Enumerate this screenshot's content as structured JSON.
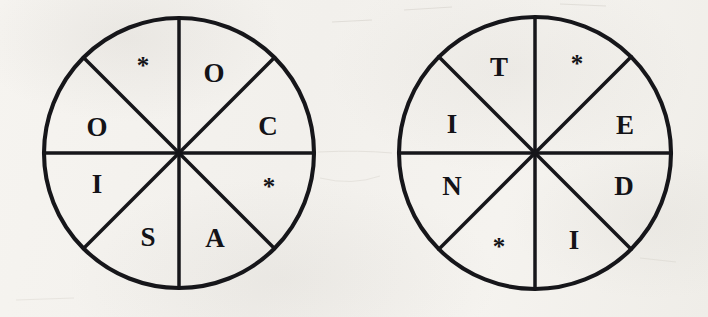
{
  "page": {
    "background_color": "#f4f2ee",
    "ink_color": "#16161a",
    "width": 708,
    "height": 317
  },
  "wheels": [
    {
      "id": "wheel-left",
      "name": "left-word-wheel",
      "center_x": 179,
      "center_y": 153,
      "radius": 135,
      "sector_count": 8,
      "sectors": [
        {
          "position": "top-right",
          "angle_deg": 67.5,
          "label": "O"
        },
        {
          "position": "right-upper",
          "angle_deg": 22.5,
          "label": "C"
        },
        {
          "position": "right-lower",
          "angle_deg": -22.5,
          "label": "*"
        },
        {
          "position": "bottom-right",
          "angle_deg": -67.5,
          "label": "A"
        },
        {
          "position": "bottom-left",
          "angle_deg": 247.5,
          "label": "S"
        },
        {
          "position": "left-lower",
          "angle_deg": 202.5,
          "label": "I"
        },
        {
          "position": "left-upper",
          "angle_deg": 157.5,
          "label": "O"
        },
        {
          "position": "top-left",
          "angle_deg": 112.5,
          "label": "*"
        }
      ],
      "labels_clockwise_from_top_right": [
        "O",
        "C",
        "*",
        "A",
        "S",
        "I",
        "O",
        "*"
      ]
    },
    {
      "id": "wheel-right",
      "name": "right-word-wheel",
      "center_x": 535,
      "center_y": 153,
      "radius": 136,
      "sector_count": 8,
      "sectors": [
        {
          "position": "top-right",
          "angle_deg": 67.5,
          "label": "*"
        },
        {
          "position": "right-upper",
          "angle_deg": 22.5,
          "label": "E"
        },
        {
          "position": "right-lower",
          "angle_deg": -22.5,
          "label": "D"
        },
        {
          "position": "bottom-right",
          "angle_deg": -67.5,
          "label": "I"
        },
        {
          "position": "bottom-left",
          "angle_deg": 247.5,
          "label": "*"
        },
        {
          "position": "left-lower",
          "angle_deg": 202.5,
          "label": "N"
        },
        {
          "position": "left-upper",
          "angle_deg": 157.5,
          "label": "I"
        },
        {
          "position": "top-left",
          "angle_deg": 112.5,
          "label": "T"
        }
      ],
      "labels_clockwise_from_top_right": [
        "*",
        "E",
        "D",
        "I",
        "*",
        "N",
        "I",
        "T"
      ]
    }
  ]
}
